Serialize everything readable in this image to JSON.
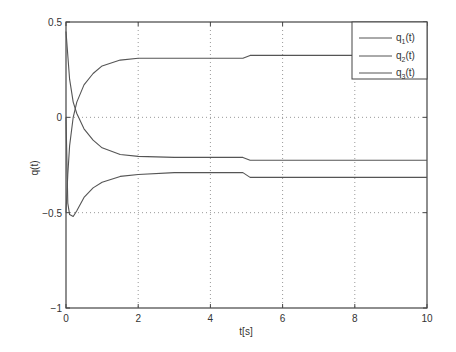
{
  "chart_data": {
    "type": "line",
    "title": "",
    "xlabel": "t[s]",
    "ylabel": "q(t)",
    "xlim": [
      0,
      10
    ],
    "ylim": [
      -1,
      0.5
    ],
    "xticks": [
      "0",
      "2",
      "4",
      "6",
      "8",
      "10"
    ],
    "yticks": [
      "0.5",
      "0",
      "-0.5",
      "-1"
    ],
    "grid": true,
    "legend_position": "upper right",
    "line_color": "#555555",
    "series": [
      {
        "name": "q1(t)",
        "x": [
          0,
          0.1,
          0.2,
          0.3,
          0.5,
          0.75,
          1,
          1.5,
          2,
          3,
          4,
          4.9,
          5.1,
          6,
          8,
          10
        ],
        "values": [
          0.45,
          0.2,
          0.08,
          0.02,
          -0.06,
          -0.12,
          -0.16,
          -0.195,
          -0.205,
          -0.21,
          -0.21,
          -0.21,
          -0.225,
          -0.225,
          -0.225,
          -0.225
        ]
      },
      {
        "name": "q2(t)",
        "x": [
          0,
          0.05,
          0.1,
          0.2,
          0.3,
          0.5,
          0.75,
          1,
          1.5,
          2,
          3,
          4,
          4.9,
          5.1,
          6,
          8,
          10
        ],
        "values": [
          -0.5,
          -0.3,
          -0.15,
          0.0,
          0.08,
          0.17,
          0.23,
          0.27,
          0.3,
          0.31,
          0.31,
          0.31,
          0.31,
          0.325,
          0.325,
          0.325,
          0.325
        ]
      },
      {
        "name": "q3(t)",
        "x": [
          0,
          0.05,
          0.1,
          0.2,
          0.3,
          0.5,
          0.75,
          1,
          1.5,
          2,
          3,
          4,
          4.9,
          5.1,
          6,
          8,
          10
        ],
        "values": [
          0.0,
          -0.45,
          -0.51,
          -0.52,
          -0.49,
          -0.42,
          -0.37,
          -0.34,
          -0.31,
          -0.3,
          -0.29,
          -0.29,
          -0.29,
          -0.315,
          -0.315,
          -0.315,
          -0.315
        ]
      }
    ]
  },
  "legend": {
    "q1": "q",
    "q1_sub": "1",
    "q2": "q",
    "q2_sub": "2",
    "q3": "q",
    "q3_sub": "3",
    "suffix": "(t)"
  }
}
